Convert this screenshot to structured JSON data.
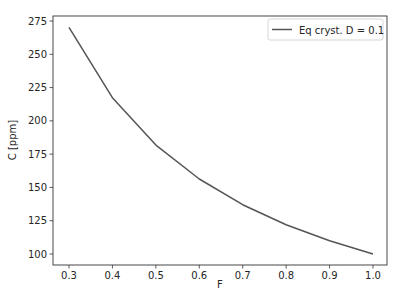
{
  "chart_data": {
    "type": "line",
    "title": "",
    "xlabel": "F",
    "ylabel": "C [ppm]",
    "xlim": [
      0.265,
      1.035
    ],
    "ylim": [
      91.5,
      278.5
    ],
    "x_ticks": [
      0.3,
      0.4,
      0.5,
      0.6,
      0.7,
      0.8,
      0.9,
      1.0
    ],
    "x_tick_labels": [
      "0.3",
      "0.4",
      "0.5",
      "0.6",
      "0.7",
      "0.8",
      "0.9",
      "1.0"
    ],
    "y_ticks": [
      100,
      125,
      150,
      175,
      200,
      225,
      250,
      275
    ],
    "y_tick_labels": [
      "100",
      "125",
      "150",
      "175",
      "200",
      "225",
      "250",
      "275"
    ],
    "grid": false,
    "legend_position": "upper right",
    "series": [
      {
        "name": "Eq cryst. D = 0.1",
        "color": "#555555",
        "x": [
          0.3,
          0.4,
          0.5,
          0.6,
          0.7,
          0.8,
          0.9,
          1.0
        ],
        "values": [
          270.3,
          217.4,
          181.8,
          156.3,
          137.0,
          122.0,
          109.9,
          100.0
        ]
      }
    ]
  },
  "legend": {
    "entries": [
      "Eq cryst. D = 0.1"
    ]
  }
}
